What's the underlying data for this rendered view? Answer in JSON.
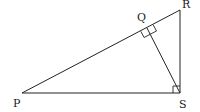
{
  "diagram": {
    "type": "geometry",
    "points": {
      "P": {
        "label": "P",
        "x": 22,
        "y": 93
      },
      "S": {
        "label": "S",
        "x": 180,
        "y": 93
      },
      "R": {
        "label": "R",
        "x": 180,
        "y": 10
      },
      "Q": {
        "label": "Q",
        "x": 147,
        "y": 28
      }
    },
    "segments": [
      "PS",
      "SR",
      "PR",
      "QS"
    ],
    "right_angles": [
      "PSR",
      "PQS"
    ],
    "labels": {
      "P": "P",
      "Q": "Q",
      "R": "R",
      "S": "S"
    }
  }
}
